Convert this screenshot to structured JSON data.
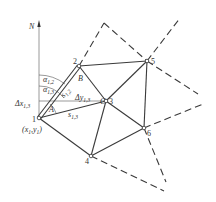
{
  "diagram": {
    "type": "triangulation-network",
    "axis": {
      "label": "N"
    },
    "points": [
      {
        "id": "1",
        "label": "1",
        "coord_label": "(x1,y1)",
        "x": 39,
        "y": 118
      },
      {
        "id": "2",
        "label": "2",
        "x": 79,
        "y": 66
      },
      {
        "id": "3",
        "label": "3",
        "x": 106,
        "y": 101
      },
      {
        "id": "4",
        "label": "4",
        "x": 91,
        "y": 156
      },
      {
        "id": "5",
        "label": "5",
        "x": 147,
        "y": 61
      },
      {
        "id": "6",
        "label": "6",
        "x": 144,
        "y": 128
      }
    ],
    "angle_labels": {
      "A": "A",
      "B": "B",
      "C": "C"
    },
    "annotations": {
      "alpha12": "α",
      "alpha12_sub": "1,2",
      "alpha13": "α",
      "alpha13_sub": "1,3",
      "dx13": "Δx",
      "dx13_sub": "1,3",
      "dy13": "Δy",
      "dy13_sub": "1,3",
      "s12": "s",
      "s12_sub": "1,2",
      "s13": "s",
      "s13_sub": "1,3",
      "coord_x": "(x",
      "coord_x_sub": "1",
      "coord_mid": ",y",
      "coord_y_sub": "1",
      "coord_end": ")"
    },
    "solid_edges": [
      [
        "1",
        "2"
      ],
      [
        "1",
        "3"
      ],
      [
        "1",
        "4"
      ],
      [
        "2",
        "3"
      ],
      [
        "2",
        "5"
      ],
      [
        "3",
        "5"
      ],
      [
        "3",
        "4"
      ],
      [
        "3",
        "6"
      ],
      [
        "4",
        "6"
      ],
      [
        "5",
        "6"
      ]
    ],
    "dashed_edges": [
      "2-apex",
      "apex-5",
      "5-NE",
      "5-SE",
      "6-E",
      "6-S",
      "4-SE"
    ]
  }
}
